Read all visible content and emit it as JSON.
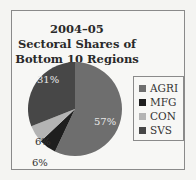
{
  "chart_data": {
    "type": "pie",
    "title": "2004–05 Sectoral Shares of Bottom 10 Regions",
    "title_lines": [
      "2004–05",
      "Sectoral Shares of",
      "Bottom 10 Regions"
    ],
    "categories": [
      "AGRI",
      "MFG",
      "CON",
      "SVS"
    ],
    "values": [
      57,
      6,
      6,
      31
    ],
    "value_labels": [
      "57%",
      "6%",
      "6%",
      "31%"
    ],
    "colors": [
      "#6e6e6e",
      "#1e1e1e",
      "#b4b4b4",
      "#474747"
    ],
    "legend_position": "right",
    "start_angle": "top, clockwise"
  }
}
